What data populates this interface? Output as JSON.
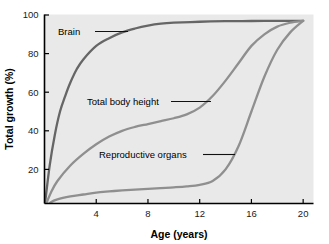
{
  "chart_data": {
    "type": "line",
    "title": "",
    "xlabel": "Age (years)",
    "ylabel": "Total growth (%)",
    "xlim": [
      0,
      20.8
    ],
    "ylim": [
      0,
      100
    ],
    "xticks": [
      4,
      8,
      12,
      16,
      20
    ],
    "yticks": [
      20,
      40,
      60,
      80,
      100
    ],
    "xtick_labels": [
      "4",
      "8",
      "12",
      "16",
      "20"
    ],
    "ytick_labels": [
      "20",
      "40",
      "60",
      "80",
      "100"
    ],
    "grid": false,
    "legend": "inline-annotations",
    "plot_background": "#e9e9e9",
    "series": [
      {
        "name": "Brain",
        "label": "Brain",
        "color": "#666666",
        "x": [
          0,
          0.4,
          0.8,
          1.2,
          1.6,
          2,
          2.5,
          3,
          4,
          5,
          6,
          7,
          8,
          9,
          10,
          12,
          14,
          16,
          18,
          20
        ],
        "values": [
          0,
          22,
          38,
          50,
          58,
          65,
          72,
          77,
          84,
          88,
          91,
          93,
          94.5,
          95.5,
          96,
          96.5,
          96.8,
          96.9,
          97,
          97
        ]
      },
      {
        "name": "Total body height",
        "label": "Total body height",
        "color": "#8f8f8f",
        "x": [
          0,
          0.5,
          1,
          2,
          3,
          4,
          5,
          6,
          7,
          8,
          9,
          10,
          11,
          12,
          13,
          14,
          15,
          16,
          17,
          18,
          19,
          20
        ],
        "values": [
          0,
          8,
          14,
          22,
          28,
          33,
          37,
          40,
          42,
          43.5,
          45,
          46.5,
          48.5,
          52,
          58,
          66,
          75,
          84,
          90,
          94,
          96,
          97
        ]
      },
      {
        "name": "Reproductive organs",
        "label": "Reproductive organs",
        "color": "#8f8f8f",
        "x": [
          0,
          0.5,
          1,
          2,
          3,
          4,
          5,
          6,
          7,
          8,
          9,
          10,
          11,
          12,
          13,
          14,
          15,
          16,
          17,
          18,
          19,
          20
        ],
        "values": [
          0,
          3,
          4.5,
          6,
          7,
          8,
          8.6,
          9.1,
          9.5,
          9.9,
          10.3,
          10.7,
          11.2,
          12,
          14,
          20,
          32,
          50,
          68,
          82,
          91,
          97
        ]
      }
    ],
    "annotations": [
      {
        "name": "brain",
        "text": "Brain",
        "text_x": 58,
        "text_y": 35,
        "leader_x1": 95,
        "leader_y1": 31.5,
        "leader_x2": 128,
        "leader_y2": 31.5
      },
      {
        "name": "total-body-height",
        "text": "Total body height",
        "text_x": 87,
        "text_y": 105,
        "leader_x1": 171,
        "leader_y1": 101.5,
        "leader_x2": 211,
        "leader_y2": 101.5
      },
      {
        "name": "reproductive-organs",
        "text": "Reproductive organs",
        "text_x": 99,
        "text_y": 158,
        "leader_x1": 203,
        "leader_y1": 154.5,
        "leader_x2": 235,
        "leader_y2": 154.5
      }
    ]
  },
  "axes": {
    "x_title": "Age (years)",
    "y_title": "Total growth (%)"
  }
}
